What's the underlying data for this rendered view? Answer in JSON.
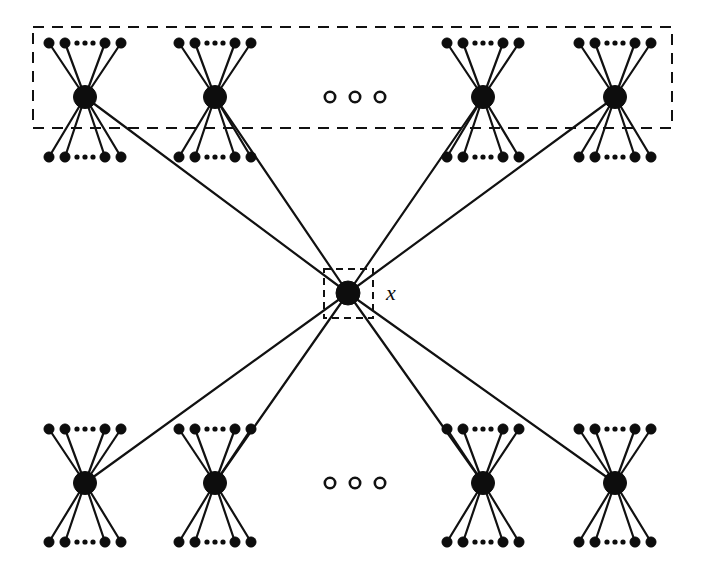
{
  "figure": {
    "type": "graph-diagram",
    "background_color": "#ffffff",
    "ink_color": "#0d0d0d",
    "width": 704,
    "height": 581
  },
  "labels": {
    "center_vertex": "x"
  },
  "center_node": {
    "name": "x",
    "cx": 348,
    "cy": 293,
    "r": 12,
    "box": {
      "x": 324,
      "y": 269,
      "width": 49,
      "height": 49
    },
    "label_x": 386,
    "label_y": 300
  },
  "dashed_region": {
    "name": "top-group-region",
    "x": 33,
    "y": 27,
    "width": 639,
    "height": 101
  },
  "clusters": {
    "leaf_radius": 5.2,
    "hub_radius": 11.5,
    "leaf_offsets": [
      -36,
      -20,
      20,
      36
    ],
    "ellipsis_offsets": [
      -8,
      0,
      8
    ],
    "ellipsis_radius": 2.6,
    "top_row": {
      "hub_y": 97,
      "upper_leaf_y": 43,
      "lower_leaf_y": 157,
      "hubs_x": [
        85,
        215,
        483,
        615
      ]
    },
    "bottom_row": {
      "hub_y": 483,
      "upper_leaf_y": 429,
      "lower_leaf_y": 542,
      "hubs_x": [
        85,
        215,
        483,
        615
      ]
    }
  },
  "ellipsis_groups": [
    {
      "name": "top-row-ellipsis",
      "cy": 97,
      "cxs": [
        330,
        355,
        380
      ],
      "r": 5.2
    },
    {
      "name": "bottom-row-ellipsis",
      "cy": 483,
      "cxs": [
        330,
        355,
        380
      ],
      "r": 5.2
    }
  ],
  "long_edges": [
    {
      "from": "center",
      "to": "top-hub-1"
    },
    {
      "from": "center",
      "to": "top-hub-2"
    },
    {
      "from": "center",
      "to": "top-hub-3"
    },
    {
      "from": "center",
      "to": "top-hub-4"
    },
    {
      "from": "center",
      "to": "bottom-hub-1"
    },
    {
      "from": "center",
      "to": "bottom-hub-2"
    },
    {
      "from": "center",
      "to": "bottom-hub-3"
    },
    {
      "from": "center",
      "to": "bottom-hub-4"
    }
  ]
}
